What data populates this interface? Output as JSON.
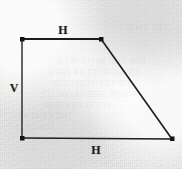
{
  "figure": {
    "kind": "geometry-diagram",
    "shape_name": "trapezoid",
    "canvas": {
      "width": 182,
      "height": 169
    },
    "background_color": "#efeeed",
    "ink_color": "#1c1c1c",
    "stroke_width": 1.6,
    "vertex_marker": {
      "shape": "square",
      "size": 4,
      "color": "#161616"
    },
    "vertices": [
      {
        "name": "top-left",
        "x": 22,
        "y": 39
      },
      {
        "name": "top-right",
        "x": 101,
        "y": 39
      },
      {
        "name": "bottom-right",
        "x": 172,
        "y": 139
      },
      {
        "name": "bottom-left",
        "x": 22,
        "y": 138
      }
    ],
    "edges": [
      {
        "name": "top-edge",
        "from": "top-left",
        "to": "top-right",
        "label": "H"
      },
      {
        "name": "right-edge",
        "from": "top-right",
        "to": "bottom-right",
        "label": ""
      },
      {
        "name": "bottom-edge",
        "from": "bottom-left",
        "to": "bottom-right",
        "label": "H"
      },
      {
        "name": "left-edge",
        "from": "top-left",
        "to": "bottom-left",
        "label": "V"
      }
    ],
    "labels": [
      {
        "name": "top-edge-label",
        "text": "H",
        "x": 63,
        "y": 30
      },
      {
        "name": "left-edge-label",
        "text": "V",
        "x": 14,
        "y": 88
      },
      {
        "name": "bottom-edge-label",
        "text": "H",
        "x": 96,
        "y": 150
      }
    ],
    "bleed_through_lines": [
      {
        "text": "THE SMALL",
        "x": 118,
        "y": 22
      },
      {
        "text": "FOR THE MOTION OF",
        "x": 56,
        "y": 56
      },
      {
        "text": "IN A CIRCULAR PATH",
        "x": 48,
        "y": 67
      },
      {
        "text": "OF THE STRING IS",
        "x": 52,
        "y": 78
      },
      {
        "text": "WHEN  THE VELOCITY",
        "x": 40,
        "y": 89
      },
      {
        "text": "ACCELERATION",
        "x": 44,
        "y": 100
      },
      {
        "text": "THE CENTRE",
        "x": 18,
        "y": 111
      },
      {
        "text": "FORCE IS",
        "x": 14,
        "y": 122
      }
    ]
  }
}
